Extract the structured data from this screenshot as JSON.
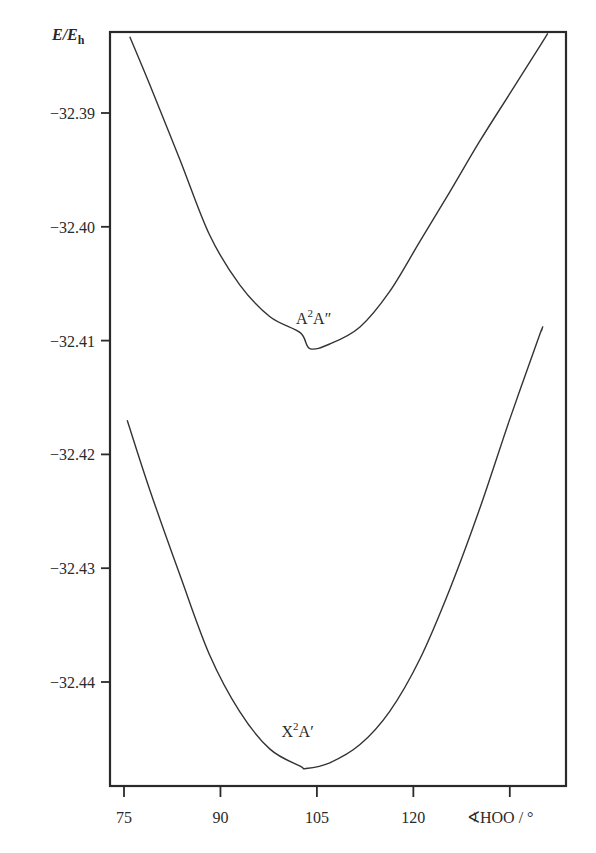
{
  "chart_data": {
    "type": "line",
    "title": "",
    "xlabel": "∢HOO / °",
    "ylabel": "E/E_h",
    "ylabel_main": "E/E",
    "ylabel_sub": "h",
    "xlim": [
      72,
      143
    ],
    "ylim": [
      -32.4491,
      -32.3821
    ],
    "x_ticks": [
      75,
      90,
      105,
      120,
      135
    ],
    "x_tick_labels": [
      "75",
      "90",
      "105",
      "120",
      ""
    ],
    "y_ticks": [
      -32.39,
      -32.4,
      -32.41,
      -32.42,
      -32.43,
      -32.44
    ],
    "y_tick_labels": [
      "−32.39",
      "−32.40",
      "−32.41",
      "−32.42",
      "−32.43",
      "−32.44"
    ],
    "grid": false,
    "legend": "none (curves labeled inline)",
    "series": [
      {
        "name": "A²A″",
        "label_main": "A",
        "label_sup": "2",
        "label_tail": "A″",
        "label_pos": {
          "x": 104.5,
          "y": -32.4085
        },
        "minimum": {
          "x": 103.9,
          "y": -32.4107
        },
        "x": [
          75.9,
          79.0,
          83.7,
          88.3,
          93.0,
          97.7,
          102.4,
          103.9,
          107.0,
          111.7,
          116.3,
          121.0,
          125.7,
          130.3,
          135.0,
          139.7,
          140.9
        ],
        "y": [
          -32.3833,
          -32.3875,
          -32.3941,
          -32.4007,
          -32.4051,
          -32.4079,
          -32.4093,
          -32.4107,
          -32.4103,
          -32.4088,
          -32.4057,
          -32.4013,
          -32.3969,
          -32.3925,
          -32.3883,
          -32.3841,
          -32.383
        ]
      },
      {
        "name": "X²A′",
        "label_main": "X",
        "label_sup": "2",
        "label_tail": "A′",
        "label_pos": {
          "x": 102.0,
          "y": -32.4448
        },
        "minimum": {
          "x": 103.3,
          "y": -32.4476
        },
        "x": [
          75.5,
          79.0,
          83.7,
          88.3,
          93.0,
          97.7,
          102.4,
          103.3,
          107.0,
          111.7,
          116.3,
          121.0,
          125.7,
          130.3,
          135.0,
          139.7,
          139.9
        ],
        "y": [
          -32.417,
          -32.4231,
          -32.4306,
          -32.4376,
          -32.4426,
          -32.4459,
          -32.4474,
          -32.4476,
          -32.4471,
          -32.4455,
          -32.4426,
          -32.438,
          -32.4318,
          -32.4248,
          -32.4169,
          -32.4094,
          -32.4092
        ]
      }
    ],
    "line_color": "#333333",
    "axis_color": "#2a2a2a"
  }
}
